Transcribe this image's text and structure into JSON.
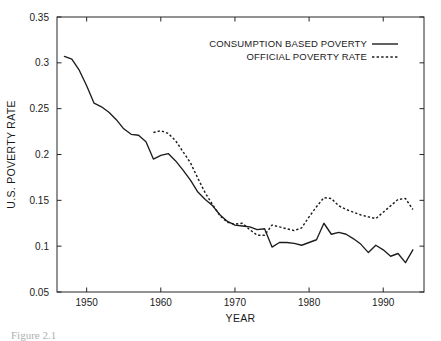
{
  "figure": {
    "caption": "Figure 2.1"
  },
  "chart_data": {
    "type": "line",
    "title": "",
    "xlabel": "YEAR",
    "ylabel": "U.S. POVERTY RATE",
    "xlim": [
      1946,
      1995.5
    ],
    "ylim": [
      0.05,
      0.35
    ],
    "grid": false,
    "legend_position": "top-right",
    "xticks": [
      1950,
      1960,
      1970,
      1980,
      1990
    ],
    "xtick_labels": [
      "1950",
      "1960",
      "1970",
      "1980",
      "1990"
    ],
    "yticks": [
      0.05,
      0.1,
      0.15,
      0.2,
      0.25,
      0.3,
      0.35
    ],
    "ytick_labels": [
      "0.05",
      "0.1",
      "0.15",
      "0.2",
      "0.25",
      "0.3",
      "0.35"
    ],
    "series": [
      {
        "name": "CONSUMPTION BASED POVERTY",
        "style": "solid",
        "x": [
          1947,
          1948,
          1949,
          1950,
          1951,
          1952,
          1953,
          1954,
          1955,
          1956,
          1957,
          1958,
          1959,
          1960,
          1961,
          1962,
          1963,
          1964,
          1965,
          1966,
          1967,
          1968,
          1969,
          1970,
          1971,
          1972,
          1973,
          1974,
          1975,
          1976,
          1977,
          1978,
          1979,
          1980,
          1981,
          1982,
          1983,
          1984,
          1985,
          1986,
          1987,
          1988,
          1989,
          1990,
          1991,
          1992,
          1993,
          1994
        ],
        "values": [
          0.307,
          0.304,
          0.292,
          0.275,
          0.256,
          0.252,
          0.246,
          0.238,
          0.228,
          0.222,
          0.221,
          0.214,
          0.195,
          0.199,
          0.201,
          0.193,
          0.183,
          0.172,
          0.159,
          0.151,
          0.144,
          0.134,
          0.127,
          0.123,
          0.122,
          0.121,
          0.118,
          0.119,
          0.099,
          0.104,
          0.104,
          0.103,
          0.101,
          0.104,
          0.107,
          0.125,
          0.113,
          0.115,
          0.113,
          0.108,
          0.102,
          0.093,
          0.101,
          0.096,
          0.089,
          0.092,
          0.082,
          0.096
        ]
      },
      {
        "name": "OFFICIAL POVERTY RATE",
        "style": "dotted",
        "x": [
          1959,
          1960,
          1961,
          1962,
          1963,
          1964,
          1965,
          1966,
          1967,
          1968,
          1969,
          1970,
          1971,
          1972,
          1973,
          1974,
          1975,
          1976,
          1977,
          1978,
          1979,
          1980,
          1981,
          1982,
          1983,
          1984,
          1985,
          1986,
          1987,
          1988,
          1989,
          1990,
          1991,
          1992,
          1993,
          1994
        ],
        "values": [
          0.224,
          0.226,
          0.223,
          0.215,
          0.203,
          0.191,
          0.174,
          0.158,
          0.145,
          0.133,
          0.126,
          0.124,
          0.125,
          0.118,
          0.112,
          0.112,
          0.123,
          0.121,
          0.119,
          0.117,
          0.12,
          0.132,
          0.143,
          0.153,
          0.152,
          0.144,
          0.14,
          0.137,
          0.134,
          0.132,
          0.13,
          0.137,
          0.144,
          0.151,
          0.152,
          0.14
        ]
      }
    ]
  }
}
